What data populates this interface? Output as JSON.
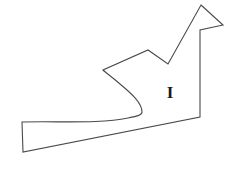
{
  "figure": {
    "background_color": "#ffffff",
    "stroke_color": "#4a4a4a",
    "stroke_width": 1.1,
    "fill_color": "none",
    "width": 247,
    "height": 169,
    "outline_path": "M 201 5 L 223 25 L 200 30 L 200 117 L 23 152 L 22 122 C 60 121 100 124 128 118 C 138 116 142 115 142 112 C 142 103 132 94 120 84 C 112 77 106 73 103 70 L 148 50 L 168 64 Z",
    "shape_description": "irregular closed outline with arrow-like peak, v-notch and curved tail"
  },
  "labels": [
    {
      "name": "region-label-i",
      "text": "I",
      "x": 170,
      "y": 92,
      "font_size": 17,
      "color": "#1a1a1a"
    }
  ]
}
